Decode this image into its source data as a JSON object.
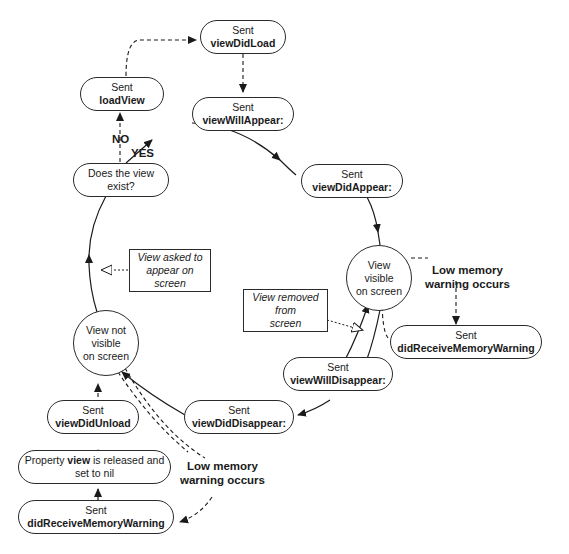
{
  "diagram": {
    "nodes": {
      "view_did_load": {
        "line1": "Sent",
        "line2": "viewDidLoad"
      },
      "load_view": {
        "line1": "Sent",
        "line2": "loadView"
      },
      "view_will_appear": {
        "line1": "Sent",
        "line2": "viewWillAppear:"
      },
      "does_view_exist": {
        "line1": "Does the view",
        "line2": "exist?"
      },
      "view_did_appear": {
        "line1": "Sent",
        "line2": "viewDidAppear:"
      },
      "view_visible": {
        "line1": "View",
        "line2": "visible",
        "line3": "on screen"
      },
      "did_receive_memory_warning_right": {
        "line1": "Sent",
        "line2": "didReceiveMemoryWarning"
      },
      "view_will_disappear": {
        "line1": "Sent",
        "line2": "viewWillDisappear:"
      },
      "view_did_disappear": {
        "line1": "Sent",
        "line2": "viewDidDisappear:"
      },
      "view_not_visible": {
        "line1": "View not",
        "line2": "visible",
        "line3": "on screen"
      },
      "view_did_unload": {
        "line1": "Sent",
        "line2": "viewDidUnload"
      },
      "property_released": {
        "prefix": "Property ",
        "bold": "view",
        "suffix": " is released and",
        "line2": "set to nil"
      },
      "did_receive_memory_warning_left": {
        "line1": "Sent",
        "line2": "didReceiveMemoryWarning"
      }
    },
    "notes": {
      "view_asked_to_appear": {
        "line1": "View asked to",
        "line2": "appear on",
        "line3": "screen"
      },
      "view_removed": {
        "line1": "View removed",
        "line2": "from",
        "line3": "screen"
      }
    },
    "labels": {
      "no": "NO",
      "yes": "YES",
      "low_memory_right": {
        "line1": "Low memory",
        "line2": "warning occurs"
      },
      "low_memory_left": {
        "line1": "Low memory",
        "line2": "warning occurs"
      }
    }
  }
}
